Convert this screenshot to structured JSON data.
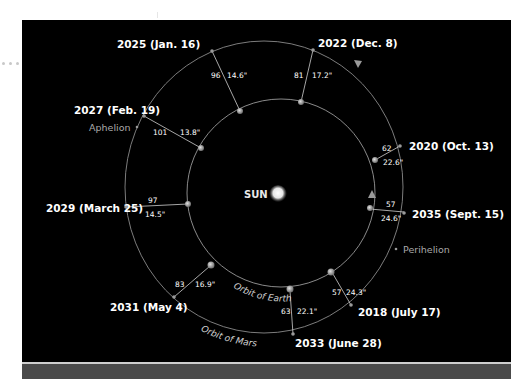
{
  "diagram": {
    "sun_label": "SUN",
    "earth_orbit_label": "Orbit of Earth",
    "mars_orbit_label": "Orbit of Mars",
    "aphelion_label": "Aphelion",
    "perihelion_label": "Perihelion",
    "oppositions": [
      {
        "label": "2025 (Jan. 16)",
        "distance": "96",
        "angular_size": "14.6\""
      },
      {
        "label": "2022 (Dec. 8)",
        "distance": "81",
        "angular_size": "17.2\""
      },
      {
        "label": "2027 (Feb. 19)",
        "distance": "101",
        "angular_size": "13.8\""
      },
      {
        "label": "2020 (Oct. 13)",
        "distance": "62",
        "angular_size": "22.6\""
      },
      {
        "label": "2035 (Sept. 15)",
        "distance": "57",
        "angular_size": "24.6\""
      },
      {
        "label": "2029 (March 25)",
        "distance": "97",
        "angular_size": "14.5\""
      },
      {
        "label": "2031 (May 4)",
        "distance": "83",
        "angular_size": "16.9\""
      },
      {
        "label": "2018 (July 17)",
        "distance": "57",
        "angular_size": "24.3\""
      },
      {
        "label": "2033 (June 28)",
        "distance": "63",
        "angular_size": "22.1\""
      }
    ]
  },
  "colors": {
    "background": "#000000",
    "orbit": "#8a8a8a",
    "text": "#ffffff",
    "muted_text": "#a9a9a9",
    "bottom_band": "#4a4a4a"
  }
}
